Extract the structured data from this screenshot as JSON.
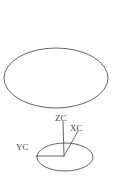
{
  "figure": {
    "background_color": "#ffffff",
    "stroke_color": "#555253",
    "label_color": "#4a4849",
    "width": 114,
    "height": 181,
    "shapes": {
      "upper_ellipse": {
        "name": "large-ellipse",
        "cx": 56,
        "cy": 78,
        "rx": 52,
        "ry": 30
      },
      "lower_ellipse": {
        "name": "small-ellipse",
        "cx": 65,
        "cy": 157,
        "rx": 28,
        "ry": 14
      }
    },
    "origin": {
      "x": 64,
      "y": 156
    },
    "axes": [
      {
        "label": "ZC",
        "from_x": 64,
        "from_y": 156,
        "to_x": 63,
        "to_y": 121
      },
      {
        "label": "XC",
        "from_x": 64,
        "from_y": 156,
        "to_x": 78,
        "to_y": 131
      },
      {
        "label": "YC",
        "from_x": 64,
        "from_y": 156,
        "to_x": 36,
        "to_y": 156
      }
    ]
  }
}
